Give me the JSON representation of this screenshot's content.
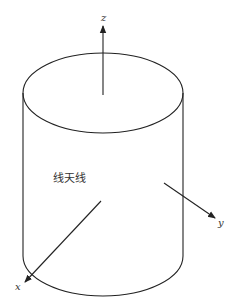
{
  "diagram": {
    "title_label": "线天线",
    "axes": {
      "x": {
        "label": "x"
      },
      "y": {
        "label": "y"
      },
      "z": {
        "label": "z"
      }
    },
    "colors": {
      "line": "#222222",
      "text": "#333333",
      "background": "#ffffff"
    }
  }
}
